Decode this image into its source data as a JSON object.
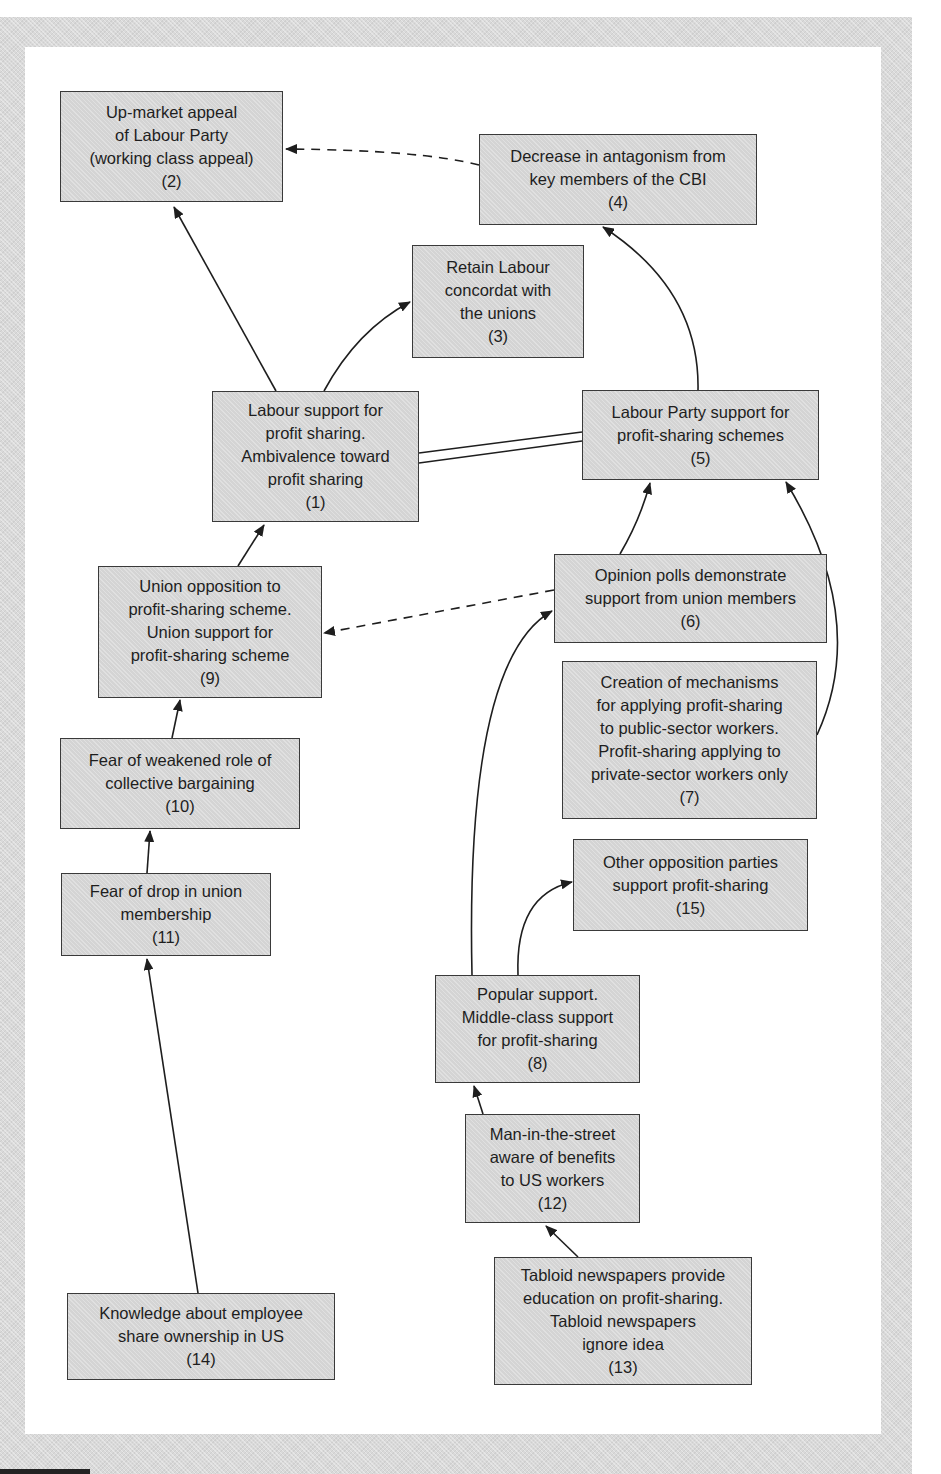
{
  "diagram": {
    "type": "cognitive-map",
    "colors": {
      "node_fill": "#d4d4d4",
      "node_border": "#3a3a3a",
      "text": "#1e1e1e",
      "frame": "#d9d9d9",
      "line": "#1e1e1e"
    },
    "nodes": [
      {
        "id": "1",
        "lines": [
          "Labour support for",
          "profit sharing.",
          "Ambivalence toward",
          "profit sharing",
          "(1)"
        ]
      },
      {
        "id": "2",
        "lines": [
          "Up-market appeal",
          "of Labour Party",
          "(working class appeal)",
          "(2)"
        ]
      },
      {
        "id": "3",
        "lines": [
          "Retain Labour",
          "concordat with",
          "the unions",
          "(3)"
        ]
      },
      {
        "id": "4",
        "lines": [
          "Decrease in antagonism from",
          "key members of the CBI",
          "(4)"
        ]
      },
      {
        "id": "5",
        "lines": [
          "Labour Party support for",
          "profit-sharing schemes",
          "(5)"
        ]
      },
      {
        "id": "6",
        "lines": [
          "Opinion polls demonstrate",
          "support from union members",
          "(6)"
        ]
      },
      {
        "id": "7",
        "lines": [
          "Creation of mechanisms",
          "for applying profit-sharing",
          "to public-sector workers.",
          "Profit-sharing applying to",
          "private-sector workers only",
          "(7)"
        ]
      },
      {
        "id": "8",
        "lines": [
          "Popular support.",
          "Middle-class support",
          "for profit-sharing",
          "(8)"
        ]
      },
      {
        "id": "9",
        "lines": [
          "Union opposition to",
          "profit-sharing scheme.",
          "Union support for",
          "profit-sharing scheme",
          "(9)"
        ]
      },
      {
        "id": "10",
        "lines": [
          "Fear of weakened role of",
          "collective bargaining",
          "(10)"
        ]
      },
      {
        "id": "11",
        "lines": [
          "Fear of drop in union",
          "membership",
          "(11)"
        ]
      },
      {
        "id": "12",
        "lines": [
          "Man-in-the-street",
          "aware of benefits",
          "to US workers",
          "(12)"
        ]
      },
      {
        "id": "13",
        "lines": [
          "Tabloid newspapers provide",
          "education on profit-sharing.",
          "Tabloid newspapers",
          "ignore idea",
          "(13)"
        ]
      },
      {
        "id": "14",
        "lines": [
          "Knowledge about employee",
          "share ownership in US",
          "(14)"
        ]
      },
      {
        "id": "15",
        "lines": [
          "Other opposition parties",
          "support profit-sharing",
          "(15)"
        ]
      }
    ],
    "edges": [
      {
        "from": "1",
        "to": "2",
        "style": "solid"
      },
      {
        "from": "1",
        "to": "3",
        "style": "solid"
      },
      {
        "from": "1",
        "to": "5",
        "style": "double",
        "arrow": false
      },
      {
        "from": "4",
        "to": "2",
        "style": "dashed"
      },
      {
        "from": "5",
        "to": "4",
        "style": "solid"
      },
      {
        "from": "6",
        "to": "5",
        "style": "solid"
      },
      {
        "from": "6",
        "to": "9",
        "style": "dashed"
      },
      {
        "from": "7",
        "to": "5",
        "style": "solid"
      },
      {
        "from": "8",
        "to": "6",
        "style": "solid"
      },
      {
        "from": "8",
        "to": "15",
        "style": "solid"
      },
      {
        "from": "9",
        "to": "1",
        "style": "solid"
      },
      {
        "from": "10",
        "to": "9",
        "style": "solid"
      },
      {
        "from": "11",
        "to": "10",
        "style": "solid"
      },
      {
        "from": "12",
        "to": "8",
        "style": "solid"
      },
      {
        "from": "13",
        "to": "12",
        "style": "solid"
      },
      {
        "from": "14",
        "to": "11",
        "style": "solid"
      }
    ]
  }
}
